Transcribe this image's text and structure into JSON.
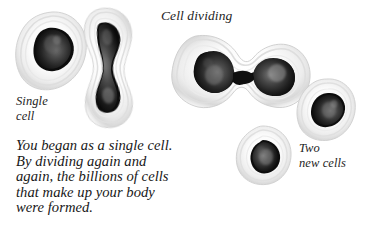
{
  "figure": {
    "background_color": "#ffffff",
    "ink_color": "#1d1d1d",
    "nucleus_color": "#1a1a1a",
    "membrane_color": "#e9e9e9"
  },
  "labels": {
    "cell_dividing": "Cell dividing",
    "single_cell": "Single\ncell",
    "two_new_cells": "Two\nnew cells"
  },
  "body_text": "You began as a single cell.\nBy dividing again and\nagain, the billions of cells\nthat make up your body\nwere formed.",
  "illustrations": [
    {
      "id": "single-cell",
      "caption": "Single cell",
      "stage": "single",
      "nuclei": 1
    },
    {
      "id": "elongating-cell",
      "caption": "",
      "stage": "elongating",
      "nuclei": 1
    },
    {
      "id": "dividing-cell",
      "caption": "Cell dividing",
      "stage": "dividing",
      "nuclei": 2
    },
    {
      "id": "daughter-cell-lower",
      "caption": "Two new cells",
      "stage": "daughter",
      "nuclei": 1
    },
    {
      "id": "daughter-cell-upper",
      "caption": "Two new cells",
      "stage": "daughter",
      "nuclei": 1
    }
  ]
}
